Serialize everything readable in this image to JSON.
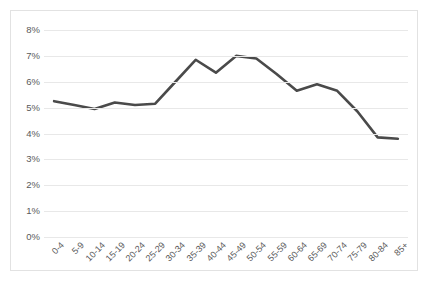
{
  "chart_data": {
    "type": "line",
    "title": "",
    "subtitle": "",
    "xlabel": "",
    "ylabel": "",
    "categories": [
      "0-4",
      "5-9",
      "10-14",
      "15-19",
      "20-24",
      "25-29",
      "30-34",
      "35-39",
      "40-44",
      "45-49",
      "50-54",
      "55-59",
      "60-64",
      "65-69",
      "70-74",
      "75-79",
      "80-84",
      "85+"
    ],
    "values": [
      5.25,
      5.1,
      4.95,
      5.2,
      5.1,
      5.15,
      6.0,
      6.85,
      6.35,
      7.0,
      6.9,
      6.3,
      5.65,
      5.9,
      5.65,
      4.85,
      3.85,
      3.8
    ],
    "series": [
      {
        "name": "share",
        "values": [
          5.25,
          5.1,
          4.95,
          5.2,
          5.1,
          5.15,
          6.0,
          6.85,
          6.35,
          7.0,
          6.9,
          6.3,
          5.65,
          5.9,
          5.65,
          4.85,
          3.85,
          3.8
        ],
        "color": "#4a4a4a"
      }
    ],
    "ylim": [
      0,
      8
    ],
    "ytick_step": 1,
    "ytick_labels": [
      "0%",
      "1%",
      "2%",
      "3%",
      "4%",
      "5%",
      "6%",
      "7%",
      "8%"
    ],
    "value_suffix": "%",
    "grid": true,
    "grid_axis": "y",
    "legend": false,
    "legend_position": "none",
    "annotations": [],
    "line_width": 2.6,
    "markers": false
  },
  "style": {
    "background": "#ffffff",
    "frame_border": "#e2e2e2",
    "gridline_color": "#e8e8e8",
    "tick_label_color": "#5a5a5a",
    "line_color": "#4a4a4a"
  }
}
